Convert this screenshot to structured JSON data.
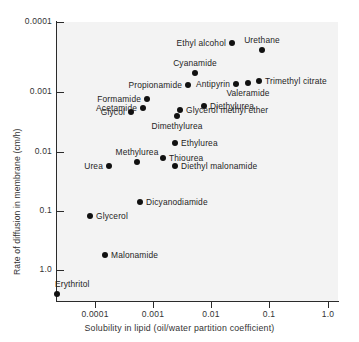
{
  "chart_data": {
    "type": "scatter",
    "title": "",
    "xlabel": "Solubility in lipid (oil/water partition coefficient)",
    "ylabel": "Rate of diffusion in membrane (cm/h)",
    "xscale": "log",
    "yscale": "log",
    "xlim": [
      2e-05,
      1.0
    ],
    "ylim": [
      2e-05,
      1.0
    ],
    "grid": false,
    "legend": false,
    "xticks": [
      "0.0001",
      "0.001",
      "0.01",
      "0.1",
      "1.0"
    ],
    "xtick_values": [
      0.0001,
      0.001,
      0.01,
      0.1,
      1.0
    ],
    "yticks": [
      "0.0001",
      "0.001",
      "0.01",
      "0.1",
      "1.0"
    ],
    "ytick_values": [
      0.0001,
      0.001,
      0.01,
      0.1,
      1.0
    ],
    "points": [
      {
        "label": "Ethyl alcohol",
        "x": 0.021,
        "y": 0.5,
        "px": 232,
        "py": 43,
        "lpos": "left"
      },
      {
        "label": "Urethane",
        "x": 0.072,
        "y": 0.39,
        "px": 262,
        "py": 50,
        "lpos": "above"
      },
      {
        "label": "Cyanamide",
        "x": 0.0046,
        "y": 0.19,
        "px": 195,
        "py": 73,
        "lpos": "above"
      },
      {
        "label": "Antipyrin",
        "x": 0.024,
        "y": 0.125,
        "px": 236,
        "py": 84,
        "lpos": "left"
      },
      {
        "label": "Valeramide",
        "x": 0.04,
        "y": 0.135,
        "px": 248,
        "py": 83,
        "lpos": "below"
      },
      {
        "label": "Trimethyl citrate",
        "x": 0.06,
        "y": 0.145,
        "px": 259,
        "py": 81,
        "lpos": "right"
      },
      {
        "label": "Propionamide",
        "x": 0.0036,
        "y": 0.115,
        "px": 188,
        "py": 85,
        "lpos": "left"
      },
      {
        "label": "Formamide",
        "x": 0.00077,
        "y": 0.068,
        "px": 147,
        "py": 99,
        "lpos": "left"
      },
      {
        "label": "Acetamide",
        "x": 0.00065,
        "y": 0.05,
        "px": 143,
        "py": 108,
        "lpos": "left"
      },
      {
        "label": "Glycol",
        "x": 0.0004,
        "y": 0.042,
        "px": 131,
        "py": 112,
        "lpos": "left"
      },
      {
        "label": "Diethylurea",
        "x": 0.0076,
        "y": 0.055,
        "px": 204,
        "py": 106,
        "lpos": "right"
      },
      {
        "label": "Glycerol methyl ether",
        "x": 0.003,
        "y": 0.05,
        "px": 180,
        "py": 110,
        "lpos": "right"
      },
      {
        "label": "Dimethylurea",
        "x": 0.0024,
        "y": 0.038,
        "px": 177,
        "py": 116,
        "lpos": "below"
      },
      {
        "label": "Ethylurea",
        "x": 0.0022,
        "y": 0.013,
        "px": 175,
        "py": 143,
        "lpos": "right"
      },
      {
        "label": "Thiourea",
        "x": 0.0013,
        "y": 0.0077,
        "px": 163,
        "py": 158,
        "lpos": "right"
      },
      {
        "label": "Diethyl malonamide",
        "x": 0.0022,
        "y": 0.0052,
        "px": 175,
        "py": 166,
        "lpos": "right"
      },
      {
        "label": "Methylurea",
        "x": 0.00052,
        "y": 0.0062,
        "px": 137,
        "py": 162,
        "lpos": "above"
      },
      {
        "label": "Urea",
        "x": 0.00016,
        "y": 0.005,
        "px": 109,
        "py": 166,
        "lpos": "left"
      },
      {
        "label": "Dicyanodiamide",
        "x": 0.00056,
        "y": 0.00105,
        "px": 140,
        "py": 202,
        "lpos": "right"
      },
      {
        "label": "Glycerol",
        "x": 0.00015,
        "y": 0.00062,
        "px": 90,
        "py": 216,
        "lpos": "right"
      },
      {
        "label": "Malonamide",
        "x": 0.00012,
        "y": 0.00012,
        "px": 105,
        "py": 255,
        "lpos": "right"
      },
      {
        "label": "Erythritol",
        "x": 2.2e-05,
        "y": 2.5e-05,
        "px": 57,
        "py": 294,
        "lpos": "above-right"
      }
    ]
  },
  "axes": {
    "x_tick_px": [
      95,
      153,
      211,
      269,
      328
    ],
    "y_tick_px": [
      22,
      92,
      152,
      211,
      270
    ]
  },
  "colors": {
    "plot_background": "#f3f3f3",
    "page_background": "#ffffff",
    "axis": "#2b2b2b",
    "marker": "#111111",
    "text": "#242424"
  }
}
